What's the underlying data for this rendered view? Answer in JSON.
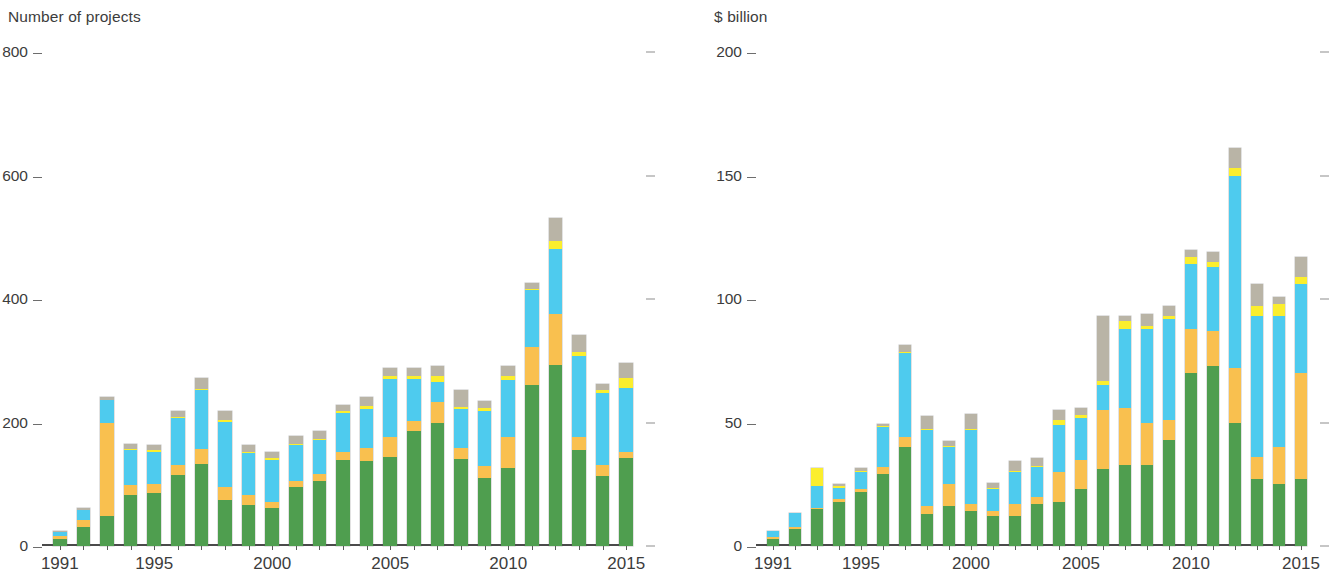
{
  "panels": [
    {
      "id": "projects",
      "title": "Number of projects",
      "ylabel": "Number of projects"
    },
    {
      "id": "investment",
      "title": "$ billion",
      "ylabel": "$ billion"
    }
  ],
  "chart_data": [
    {
      "type": "bar",
      "stacked": true,
      "title": "Number of projects",
      "xlabel": "",
      "ylabel": "Number of projects",
      "ylim": [
        0,
        800
      ],
      "yticks": [
        0,
        200,
        400,
        600,
        800
      ],
      "ytick_labels": [
        "0",
        "200",
        "400",
        "600",
        "800"
      ],
      "grid": false,
      "legend": "none",
      "x": [
        1991,
        1992,
        1993,
        1994,
        1995,
        1996,
        1997,
        1998,
        1999,
        2000,
        2001,
        2002,
        2003,
        2004,
        2005,
        2006,
        2007,
        2008,
        2009,
        2010,
        2011,
        2012,
        2013,
        2014,
        2015
      ],
      "xtick_labels": [
        "1991",
        "1995",
        "2000",
        "2005",
        "2010",
        "2015"
      ],
      "xticks": [
        1991,
        1995,
        2000,
        2005,
        2010,
        2015
      ],
      "series": [
        {
          "name": "green",
          "color": "#4f9e4f",
          "values": [
            12,
            30,
            48,
            83,
            86,
            115,
            133,
            74,
            67,
            62,
            95,
            106,
            139,
            137,
            144,
            186,
            199,
            141,
            110,
            126,
            260,
            293,
            155,
            113,
            142
          ]
        },
        {
          "name": "orange",
          "color": "#f9c04f",
          "values": [
            4,
            12,
            152,
            16,
            14,
            17,
            24,
            22,
            16,
            10,
            11,
            10,
            14,
            22,
            32,
            16,
            34,
            18,
            19,
            50,
            62,
            82,
            22,
            18,
            10
          ]
        },
        {
          "name": "blue",
          "color": "#4ecbee",
          "values": [
            6,
            17,
            37,
            56,
            53,
            75,
            96,
            105,
            67,
            68,
            58,
            56,
            62,
            63,
            95,
            68,
            33,
            63,
            90,
            93,
            92,
            106,
            130,
            117,
            104
          ]
        },
        {
          "name": "yellow",
          "color": "#fbee2e",
          "values": [
            0,
            0,
            0,
            2,
            1,
            2,
            2,
            3,
            2,
            2,
            2,
            2,
            3,
            4,
            4,
            6,
            10,
            3,
            5,
            7,
            2,
            13,
            8,
            4,
            16
          ]
        },
        {
          "name": "grey",
          "color": "#b9b4a6",
          "values": [
            3,
            3,
            4,
            8,
            8,
            10,
            17,
            14,
            11,
            10,
            12,
            13,
            11,
            15,
            13,
            12,
            15,
            27,
            11,
            15,
            10,
            37,
            27,
            11,
            24
          ]
        }
      ],
      "totals": [
        25,
        62,
        241,
        165,
        162,
        219,
        272,
        218,
        163,
        152,
        178,
        187,
        229,
        241,
        288,
        288,
        291,
        252,
        235,
        291,
        426,
        531,
        342,
        263,
        296
      ]
    },
    {
      "type": "bar",
      "stacked": true,
      "title": "$ billion",
      "xlabel": "",
      "ylabel": "$ billion",
      "ylim": [
        0,
        200
      ],
      "yticks": [
        0,
        50,
        100,
        150,
        200
      ],
      "ytick_labels": [
        "0",
        "50",
        "100",
        "150",
        "200"
      ],
      "grid": false,
      "legend": "none",
      "x": [
        1991,
        1992,
        1993,
        1994,
        1995,
        1996,
        1997,
        1998,
        1999,
        2000,
        2001,
        2002,
        2003,
        2004,
        2005,
        2006,
        2007,
        2008,
        2009,
        2010,
        2011,
        2012,
        2013,
        2014,
        2015
      ],
      "xtick_labels": [
        "1991",
        "1995",
        "2000",
        "2005",
        "2010",
        "2015"
      ],
      "xticks": [
        1991,
        1995,
        2000,
        2005,
        2010,
        2015
      ],
      "series": [
        {
          "name": "green",
          "color": "#4f9e4f",
          "values": [
            3,
            7,
            15,
            18,
            22,
            29,
            40,
            13,
            16,
            14,
            12,
            12,
            17,
            18,
            23,
            31,
            33,
            33,
            43,
            70,
            73,
            50,
            27,
            25,
            27
          ]
        },
        {
          "name": "orange",
          "color": "#f9c04f",
          "values": [
            0.5,
            0.5,
            0.5,
            1,
            1,
            3,
            4,
            3,
            9,
            3,
            2,
            5,
            3,
            12,
            12,
            24,
            23,
            17,
            8,
            18,
            14,
            22,
            9,
            15,
            43
          ]
        },
        {
          "name": "blue",
          "color": "#4ecbee",
          "values": [
            2.5,
            6,
            9,
            4.5,
            7,
            16,
            34,
            31,
            15,
            30,
            9,
            13,
            12,
            19,
            17,
            10,
            32,
            38,
            41,
            26,
            26,
            78,
            57,
            53,
            36
          ]
        },
        {
          "name": "yellow",
          "color": "#fbee2e",
          "values": [
            0,
            0,
            7,
            1,
            0.5,
            0.5,
            0.5,
            0.5,
            0.5,
            0.5,
            0.5,
            0.5,
            0.5,
            2,
            1,
            2,
            3,
            1,
            1,
            3,
            2,
            3,
            4,
            5,
            3
          ]
        },
        {
          "name": "grey",
          "color": "#b9b4a6",
          "values": [
            0,
            0,
            0,
            0.5,
            1,
            1,
            3,
            5,
            2,
            6,
            2,
            4,
            3,
            4,
            3,
            26,
            2,
            5,
            4,
            3,
            4,
            8,
            9,
            3,
            8
          ]
        }
      ],
      "totals": [
        6,
        13.5,
        31.5,
        25,
        31.5,
        49.5,
        81.5,
        52.5,
        42.5,
        53.5,
        25.5,
        34.5,
        35.5,
        55,
        56,
        93,
        93,
        94,
        97,
        120,
        119,
        161,
        106,
        101,
        117
      ]
    }
  ],
  "colors": {
    "green": "#4f9e4f",
    "orange": "#f9c04f",
    "blue": "#4ecbee",
    "yellow": "#fbee2e",
    "grey": "#b9b4a6",
    "axis": "#4a4a4a",
    "text": "#3c3c3c",
    "background": "#ffffff"
  }
}
